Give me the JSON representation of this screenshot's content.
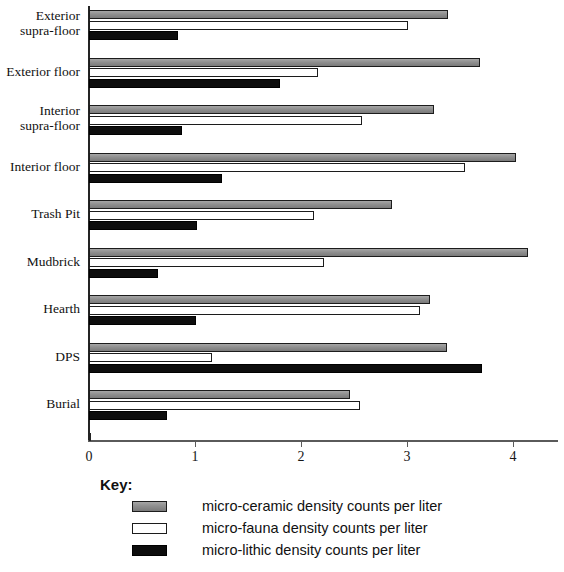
{
  "chart_data": {
    "type": "bar",
    "orientation": "horizontal",
    "title": "",
    "xlabel": "",
    "ylabel": "",
    "xlim": [
      0,
      4.45
    ],
    "grid": false,
    "legend_position": "bottom",
    "legend_title": "Key:",
    "ticks": [
      "0",
      "1",
      "2",
      "3",
      "4"
    ],
    "tick_values": [
      0,
      1,
      2,
      3,
      4
    ],
    "categories": [
      "Exterior\nsupra-floor",
      "Exterior floor",
      "Interior\nsupra-floor",
      "Interior floor",
      "Trash Pit",
      "Mudbrick",
      "Hearth",
      "DPS",
      "Burial"
    ],
    "series": [
      {
        "name": "micro-ceramic density counts per liter",
        "key": "ceramic",
        "color": "#8c8c8c",
        "values": [
          3.39,
          3.69,
          3.25,
          4.03,
          2.86,
          4.14,
          3.22,
          3.38,
          2.46
        ]
      },
      {
        "name": "micro-fauna density counts per liter",
        "key": "fauna",
        "color": "#ffffff",
        "values": [
          3.01,
          2.16,
          2.58,
          3.55,
          2.12,
          2.22,
          3.12,
          1.16,
          2.56
        ]
      },
      {
        "name": "micro-lithic density counts per liter",
        "key": "lithic",
        "color": "#0d0d0d",
        "values": [
          0.84,
          1.8,
          0.88,
          1.25,
          1.02,
          0.65,
          1.01,
          3.71,
          0.74
        ]
      }
    ]
  }
}
